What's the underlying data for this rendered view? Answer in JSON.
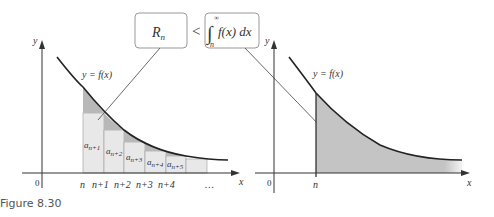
{
  "caption": "Figure 8.30",
  "callout": {
    "left_box": "R",
    "left_box_sub": "n",
    "relation": "<",
    "integral_upper": "∞",
    "integral_lower": "n",
    "integrand": "f(x) dx"
  },
  "left_graph": {
    "y_label": "y",
    "x_label": "x",
    "origin": "0",
    "curve_label": "y = f(x)",
    "x_ticks": [
      "n",
      "n+1",
      "n+2",
      "n+3",
      "n+4",
      "…"
    ],
    "bar_labels": [
      {
        "base": "a",
        "sub": "n+1"
      },
      {
        "base": "a",
        "sub": "n+2"
      },
      {
        "base": "a",
        "sub": "n+3"
      },
      {
        "base": "a",
        "sub": "n+4"
      },
      {
        "base": "a",
        "sub": "n+5"
      }
    ]
  },
  "right_graph": {
    "y_label": "y",
    "x_label": "x",
    "origin": "0",
    "curve_label": "y = f(x)",
    "x_tick": "n"
  },
  "colors": {
    "bar_fill": "#e6e6e6",
    "excess_fill": "#b5b5b5",
    "area_fill": "#c4c4c4",
    "curve": "#222222"
  }
}
